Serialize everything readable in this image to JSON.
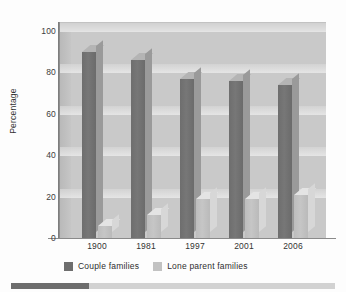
{
  "chart_data": {
    "type": "bar",
    "title": "",
    "xlabel": "",
    "ylabel": "Percentage",
    "ylim": [
      0,
      100
    ],
    "yticks": [
      0,
      20,
      40,
      60,
      80,
      100
    ],
    "grid": true,
    "legend_position": "bottom",
    "style": "3d-clustered-column",
    "categories": [
      "1900",
      "1981",
      "1997",
      "2001",
      "2006"
    ],
    "series": [
      {
        "name": "Couple families",
        "color": "#6e6e6e",
        "values": [
          90,
          86,
          77,
          76,
          74
        ]
      },
      {
        "name": "Lone parent families",
        "color": "#c2c2c2",
        "values": [
          6,
          11,
          19,
          19,
          21
        ]
      }
    ]
  },
  "axes": {
    "y_title": "Percentage",
    "y_tick_labels": [
      "100",
      "80",
      "60",
      "40",
      "20",
      "0"
    ],
    "x_tick_labels": [
      "1900",
      "1981",
      "1997",
      "2001",
      "2006"
    ]
  },
  "legend": {
    "items": [
      {
        "label": "Couple families",
        "color": "#6e6e6e"
      },
      {
        "label": "Lone parent families",
        "color": "#c2c2c2"
      }
    ]
  },
  "colors": {
    "panel_background": "#c9c9c9",
    "gridline": "#eeeeee",
    "axis": "#8a8a8a",
    "series_dark": "#6e6e6e",
    "series_light": "#c2c2c2",
    "bottom_bar_track": "#d2d2d2",
    "bottom_bar_fill": "#6d6d6d"
  },
  "bottom_bar": {
    "fill_percent": 24
  }
}
